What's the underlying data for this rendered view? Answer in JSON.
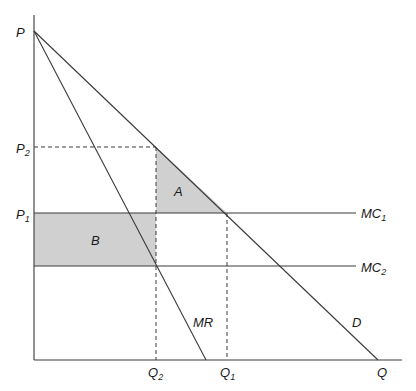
{
  "diagram": {
    "type": "economics-monopoly-welfare",
    "axes": {
      "y_label": "P",
      "x_label": "Q"
    },
    "price_labels": [
      {
        "id": "P2",
        "main": "P",
        "sub": "2"
      },
      {
        "id": "P1",
        "main": "P",
        "sub": "1"
      }
    ],
    "quantity_labels": [
      {
        "id": "Q2",
        "main": "Q",
        "sub": "2"
      },
      {
        "id": "Q1",
        "main": "Q",
        "sub": "1"
      }
    ],
    "curves": {
      "demand": "D",
      "marginal_revenue": "MR",
      "mc1": {
        "main": "MC",
        "sub": "1"
      },
      "mc2": {
        "main": "MC",
        "sub": "2"
      }
    },
    "areas": {
      "a": "A",
      "b": "B"
    },
    "colors": {
      "shade": "#d0d0d0",
      "line": "#3a3a3a",
      "background": "#ffffff"
    }
  }
}
